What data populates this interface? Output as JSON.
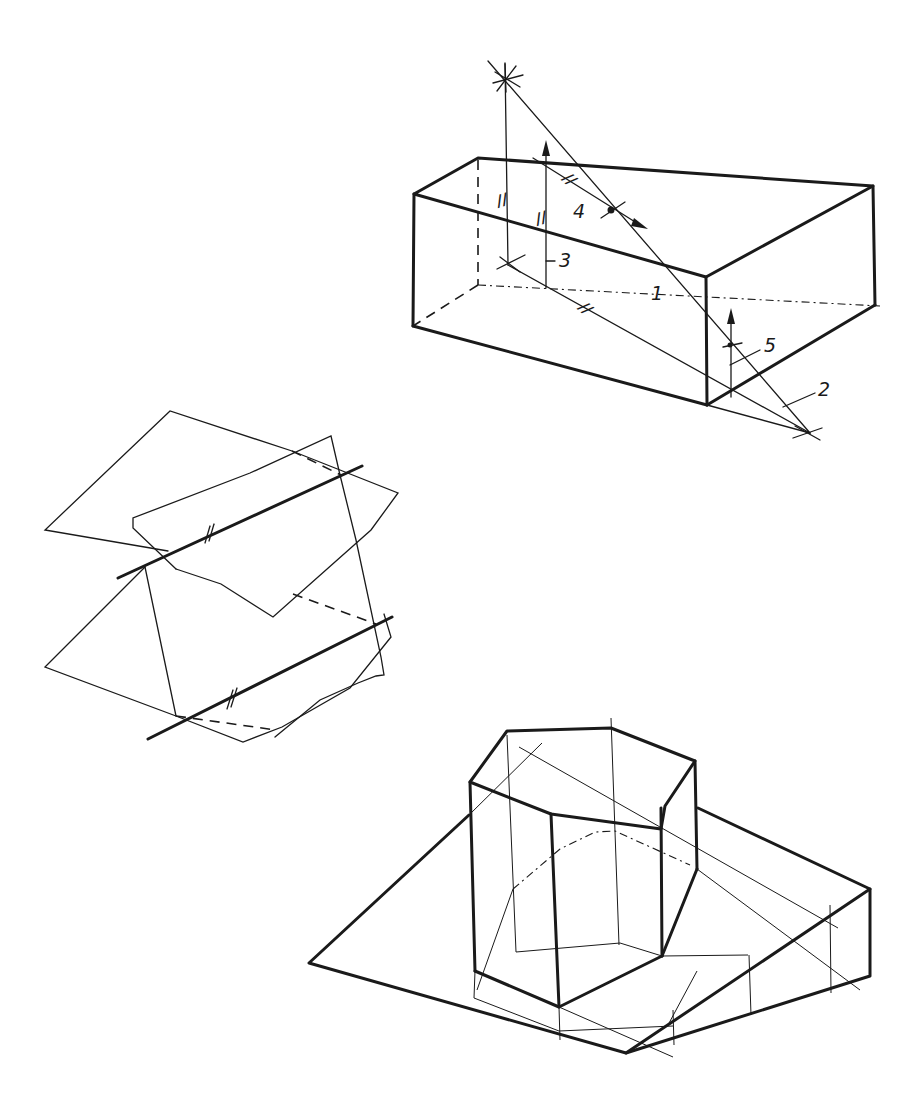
{
  "figure": {
    "type": "descriptive-geometry-sketches",
    "ink_color": "#1a1a1a",
    "paper_color": "#ffffff"
  },
  "box_drawing": {
    "labels": {
      "line_1": "1",
      "line_2": "2",
      "line_3": "3",
      "point_4": "4",
      "point_5": "5"
    },
    "parallel_marks": [
      "//",
      "//",
      "//",
      "//"
    ]
  },
  "planes_drawing": {
    "parallel_marks": [
      "//",
      "//"
    ]
  },
  "prism_drawing": {
    "shape": "hexagonal prism on inclined base"
  }
}
